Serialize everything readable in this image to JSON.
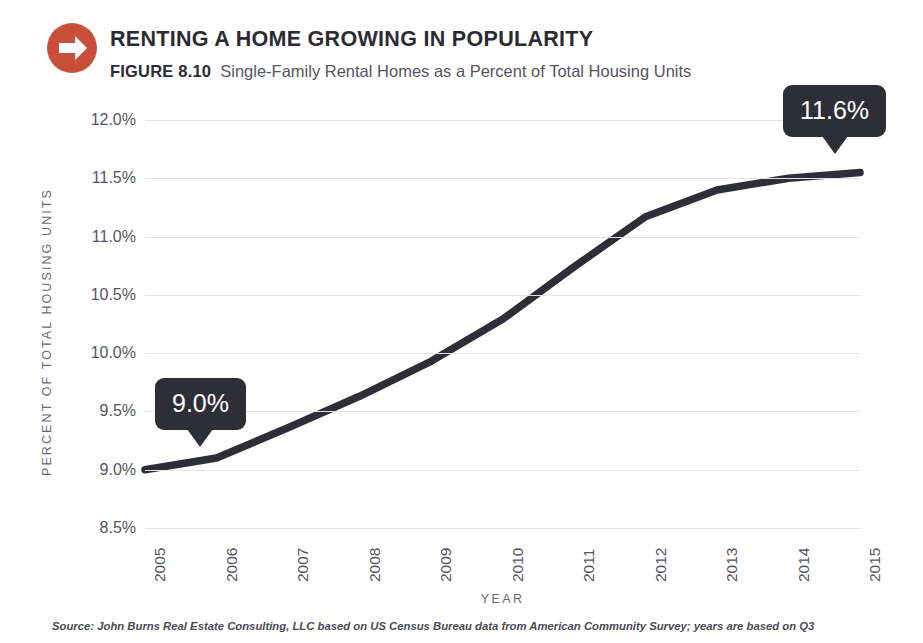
{
  "header": {
    "logo_icon": "arrow-right-circle-icon",
    "logo_color": "#c8503a",
    "title": "RENTING A HOME GROWING IN POPULARITY",
    "figure_number": "FIGURE 8.10",
    "subtitle": "Single-Family Rental Homes as a Percent of Total Housing Units"
  },
  "source": "Source: John Burns Real Estate Consulting, LLC based on US Census Bureau data from American Community Survey; years are based on Q3",
  "chart_data": {
    "type": "line",
    "title": "Single-Family Rental Homes as a Percent of Total Housing Units",
    "xlabel": "YEAR",
    "ylabel": "PERCENT OF TOTAL HOUSING UNITS",
    "x": [
      "2005",
      "2006",
      "2007",
      "2008",
      "2009",
      "2010",
      "2011",
      "2012",
      "2013",
      "2014",
      "2015"
    ],
    "values": [
      9.0,
      9.1,
      9.36,
      9.63,
      9.93,
      10.29,
      10.74,
      11.17,
      11.4,
      11.5,
      11.55
    ],
    "ylim": [
      8.5,
      12.0
    ],
    "yticks": [
      "12.0%",
      "11.5%",
      "11.0%",
      "10.5%",
      "10.0%",
      "9.5%",
      "9.0%",
      "8.5%"
    ],
    "ytick_values": [
      12.0,
      11.5,
      11.0,
      10.5,
      10.0,
      9.5,
      9.0,
      8.5
    ],
    "grid": true,
    "legend": "none",
    "line_color": "#2e2e39",
    "grid_color": "#e3e3e6",
    "annotations": [
      {
        "label": "9.0%",
        "x": "2005",
        "y": 9.0
      },
      {
        "label": "11.6%",
        "x": "2015",
        "y": 11.55
      }
    ]
  }
}
